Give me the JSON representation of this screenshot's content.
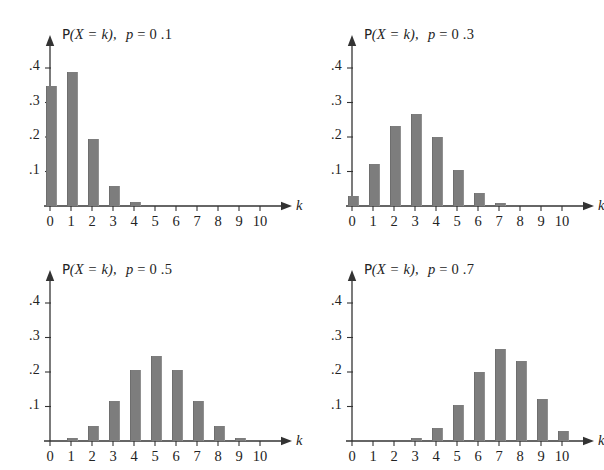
{
  "figure": {
    "background": "#ffffff",
    "bar_color": "#7d7d7d",
    "axis_color": "#333333",
    "distribution": "Binomial(n = 10, p)",
    "panel_count": 4
  },
  "axes": {
    "x_name": "k",
    "x_ticks": [
      "0",
      "1",
      "2",
      "3",
      "4",
      "5",
      "6",
      "7",
      "8",
      "9",
      "10"
    ],
    "y_ticks": [
      ".1",
      ".2",
      ".3",
      ".4"
    ]
  },
  "panels": [
    {
      "id": "panel-p-0-1",
      "p_value": "0.1",
      "title_prefix": "P",
      "title_body": "(X = k),",
      "title_param": "p",
      "title_equals": "= 0 .1"
    },
    {
      "id": "panel-p-0-3",
      "p_value": "0.3",
      "title_prefix": "P",
      "title_body": "(X = k),",
      "title_param": "p",
      "title_equals": "= 0 .3"
    },
    {
      "id": "panel-p-0-5",
      "p_value": "0.5",
      "title_prefix": "P",
      "title_body": "(X = k),",
      "title_param": "p",
      "title_equals": "= 0 .5"
    },
    {
      "id": "panel-p-0-7",
      "p_value": "0.7",
      "title_prefix": "P",
      "title_body": "(X = k),",
      "title_param": "p",
      "title_equals": "= 0 .7"
    }
  ],
  "chart_data": [
    {
      "type": "bar",
      "title": "P(X = k),  p = 0.1",
      "subtitle": "Binomial(10, 0.1) probability mass function",
      "xlabel": "k",
      "ylabel": "",
      "categories": [
        0,
        1,
        2,
        3,
        4,
        5,
        6,
        7,
        8,
        9,
        10
      ],
      "values": [
        0.349,
        0.387,
        0.194,
        0.057,
        0.011,
        0.001,
        0.0,
        0.0,
        0.0,
        0.0,
        0.0
      ],
      "xlim": [
        0,
        10
      ],
      "ylim": [
        0,
        0.44
      ],
      "ytick_values": [
        0.1,
        0.2,
        0.3,
        0.4
      ],
      "ytick_labels": [
        ".1",
        ".2",
        ".3",
        ".4"
      ],
      "xtick_labels": [
        "0",
        "1",
        "2",
        "3",
        "4",
        "5",
        "6",
        "7",
        "8",
        "9",
        "10"
      ],
      "grid": false,
      "legend": false
    },
    {
      "type": "bar",
      "title": "P(X = k),  p = 0.3",
      "subtitle": "Binomial(10, 0.3) probability mass function",
      "xlabel": "k",
      "ylabel": "",
      "categories": [
        0,
        1,
        2,
        3,
        4,
        5,
        6,
        7,
        8,
        9,
        10
      ],
      "values": [
        0.028,
        0.121,
        0.233,
        0.267,
        0.2,
        0.103,
        0.037,
        0.009,
        0.001,
        0.0,
        0.0
      ],
      "xlim": [
        0,
        10
      ],
      "ylim": [
        0,
        0.44
      ],
      "ytick_values": [
        0.1,
        0.2,
        0.3,
        0.4
      ],
      "ytick_labels": [
        ".1",
        ".2",
        ".3",
        ".4"
      ],
      "xtick_labels": [
        "0",
        "1",
        "2",
        "3",
        "4",
        "5",
        "6",
        "7",
        "8",
        "9",
        "10"
      ],
      "grid": false,
      "legend": false
    },
    {
      "type": "bar",
      "title": "P(X = k),  p = 0.5",
      "subtitle": "Binomial(10, 0.5) probability mass function",
      "xlabel": "k",
      "ylabel": "",
      "categories": [
        0,
        1,
        2,
        3,
        4,
        5,
        6,
        7,
        8,
        9,
        10
      ],
      "values": [
        0.001,
        0.01,
        0.044,
        0.117,
        0.205,
        0.246,
        0.205,
        0.117,
        0.044,
        0.01,
        0.001
      ],
      "xlim": [
        0,
        10
      ],
      "ylim": [
        0,
        0.44
      ],
      "ytick_values": [
        0.1,
        0.2,
        0.3,
        0.4
      ],
      "ytick_labels": [
        ".1",
        ".2",
        ".3",
        ".4"
      ],
      "xtick_labels": [
        "0",
        "1",
        "2",
        "3",
        "4",
        "5",
        "6",
        "7",
        "8",
        "9",
        "10"
      ],
      "grid": false,
      "legend": false
    },
    {
      "type": "bar",
      "title": "P(X = k),  p = 0.7",
      "subtitle": "Binomial(10, 0.7) probability mass function",
      "xlabel": "k",
      "ylabel": "",
      "categories": [
        0,
        1,
        2,
        3,
        4,
        5,
        6,
        7,
        8,
        9,
        10
      ],
      "values": [
        0.0,
        0.0,
        0.001,
        0.009,
        0.037,
        0.103,
        0.2,
        0.267,
        0.233,
        0.121,
        0.028
      ],
      "xlim": [
        0,
        10
      ],
      "ylim": [
        0,
        0.44
      ],
      "ytick_values": [
        0.1,
        0.2,
        0.3,
        0.4
      ],
      "ytick_labels": [
        ".1",
        ".2",
        ".3",
        ".4"
      ],
      "xtick_labels": [
        "0",
        "1",
        "2",
        "3",
        "4",
        "5",
        "6",
        "7",
        "8",
        "9",
        "10"
      ],
      "grid": false,
      "legend": false
    }
  ]
}
